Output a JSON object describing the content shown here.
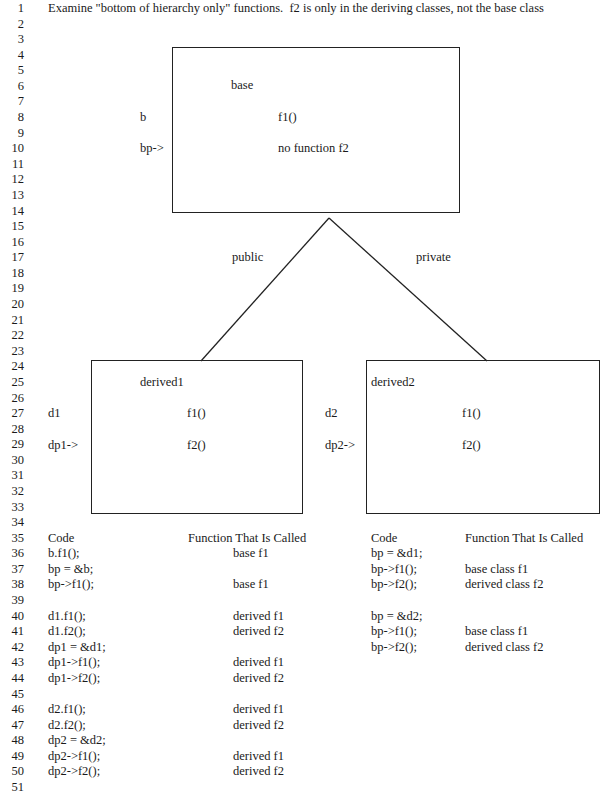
{
  "line_numbers": [
    "1",
    "2",
    "3",
    "4",
    "5",
    "6",
    "7",
    "8",
    "9",
    "10",
    "11",
    "12",
    "13",
    "14",
    "15",
    "16",
    "17",
    "18",
    "19",
    "20",
    "21",
    "22",
    "23",
    "24",
    "25",
    "26",
    "27",
    "28",
    "29",
    "30",
    "31",
    "32",
    "33",
    "34",
    "35",
    "36",
    "37",
    "38",
    "39",
    "40",
    "41",
    "42",
    "43",
    "44",
    "45",
    "46",
    "47",
    "48",
    "49",
    "50",
    "51"
  ],
  "title": "Examine \"bottom of hierarchy only\" functions.  f2 is only in the deriving classes, not the base class",
  "diagram": {
    "base": {
      "class_name": "base",
      "object_label": "b",
      "pointer_label": "bp->",
      "member1": "f1()",
      "member2": "no function f2"
    },
    "inheritance": {
      "left_label": "public",
      "right_label": "private"
    },
    "derived1": {
      "class_name": "derived1",
      "object_label": "d1",
      "pointer_label": "dp1->",
      "member1": "f1()",
      "member2": "f2()"
    },
    "derived2": {
      "class_name": "derived2",
      "object_label": "d2",
      "pointer_label": "dp2->",
      "member1": "f1()",
      "member2": "f2()"
    }
  },
  "left_table": {
    "headers": [
      "Code",
      "Function That Is Called"
    ],
    "rows": [
      {
        "line": 36,
        "code": "b.f1();",
        "result": "base f1"
      },
      {
        "line": 37,
        "code": "bp = &b;",
        "result": ""
      },
      {
        "line": 38,
        "code": "bp->f1();",
        "result": "base f1"
      },
      {
        "line": 40,
        "code": "d1.f1();",
        "result": "derived f1"
      },
      {
        "line": 41,
        "code": "d1.f2();",
        "result": "derived f2"
      },
      {
        "line": 42,
        "code": "dp1 = &d1;",
        "result": ""
      },
      {
        "line": 43,
        "code": "dp1->f1();",
        "result": "derived f1"
      },
      {
        "line": 44,
        "code": "dp1->f2();",
        "result": "derived f2"
      },
      {
        "line": 46,
        "code": "d2.f1();",
        "result": "derived f1"
      },
      {
        "line": 47,
        "code": "d2.f2();",
        "result": "derived f2"
      },
      {
        "line": 48,
        "code": "dp2 = &d2;",
        "result": ""
      },
      {
        "line": 49,
        "code": "dp2->f1();",
        "result": "derived f1"
      },
      {
        "line": 50,
        "code": "dp2->f2();",
        "result": "derived f2"
      }
    ]
  },
  "right_table": {
    "headers": [
      "Code",
      "Function That Is Called"
    ],
    "rows": [
      {
        "line": 36,
        "code": "bp = &d1;",
        "result": ""
      },
      {
        "line": 37,
        "code": "bp->f1();",
        "result": "base class f1"
      },
      {
        "line": 38,
        "code": "bp->f2();",
        "result": "derived class f2"
      },
      {
        "line": 40,
        "code": "bp = &d2;",
        "result": ""
      },
      {
        "line": 41,
        "code": "bp->f1();",
        "result": "base class f1"
      },
      {
        "line": 42,
        "code": "bp->f2();",
        "result": "derived class f2"
      }
    ]
  }
}
